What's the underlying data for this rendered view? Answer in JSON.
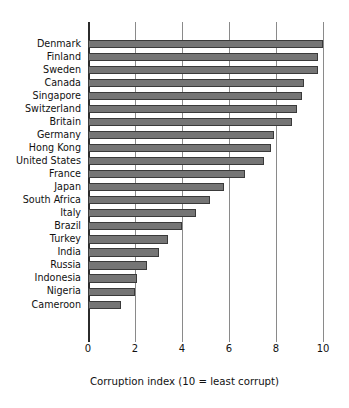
{
  "chart_data": {
    "type": "bar",
    "orientation": "horizontal",
    "title": "",
    "subtitle": "",
    "xlabel": "Corruption index (10 = least corrupt)",
    "ylabel": "",
    "xlim": [
      0,
      10
    ],
    "xticks": [
      0,
      2,
      4,
      6,
      8,
      10
    ],
    "xtick_labels": [
      "0",
      "2",
      "4",
      "6",
      "8",
      "10"
    ],
    "grid": true,
    "grid_axis": "x",
    "legend": false,
    "legend_position": "none",
    "bar_color": "#757575",
    "bar_edge_color": "#3a3a3a",
    "axis_color": "#2b2b2b",
    "gridline_color": "#8a8a8a",
    "background_color": "#ffffff",
    "categories": [
      "Denmark",
      "Finland",
      "Sweden",
      "Canada",
      "Singapore",
      "Switzerland",
      "Britain",
      "Germany",
      "Hong Kong",
      "United States",
      "France",
      "Japan",
      "South Africa",
      "Italy",
      "Brazil",
      "Turkey",
      "India",
      "Russia",
      "Indonesia",
      "Nigeria",
      "Cameroon"
    ],
    "values": [
      10.0,
      9.8,
      9.8,
      9.2,
      9.1,
      8.9,
      8.7,
      7.9,
      7.8,
      7.5,
      6.7,
      5.8,
      5.2,
      4.6,
      4.0,
      3.4,
      3.0,
      2.5,
      2.1,
      2.0,
      1.4
    ]
  }
}
